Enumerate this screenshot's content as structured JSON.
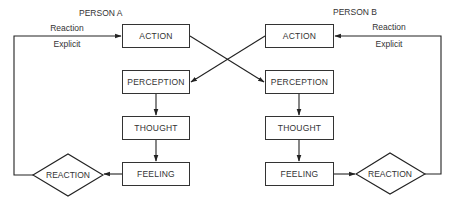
{
  "diagram": {
    "person_a": {
      "title": "PERSON A",
      "feedback_label_top": "Reaction",
      "feedback_label_bottom": "Explicit",
      "nodes": {
        "action": "ACTION",
        "perception": "PERCEPTION",
        "thought": "THOUGHT",
        "feeling": "FEELING",
        "reaction": "REACTION"
      }
    },
    "person_b": {
      "title": "PERSON B",
      "feedback_label_top": "Reaction",
      "feedback_label_bottom": "Explicit",
      "nodes": {
        "action": "ACTION",
        "perception": "PERCEPTION",
        "thought": "THOUGHT",
        "feeling": "FEELING",
        "reaction": "REACTION"
      }
    },
    "edges": [
      {
        "from": "A.action",
        "to": "B.perception"
      },
      {
        "from": "B.action",
        "to": "A.perception"
      },
      {
        "from": "A.perception",
        "to": "A.thought"
      },
      {
        "from": "A.thought",
        "to": "A.feeling"
      },
      {
        "from": "A.feeling",
        "to": "A.reaction"
      },
      {
        "from": "A.reaction",
        "to": "A.action",
        "label": "Reaction Explicit"
      },
      {
        "from": "B.perception",
        "to": "B.thought"
      },
      {
        "from": "B.thought",
        "to": "B.feeling"
      },
      {
        "from": "B.feeling",
        "to": "B.reaction"
      },
      {
        "from": "B.reaction",
        "to": "B.action",
        "label": "Reaction Explicit"
      }
    ],
    "colors": {
      "line": "#222222",
      "background": "#ffffff"
    }
  }
}
